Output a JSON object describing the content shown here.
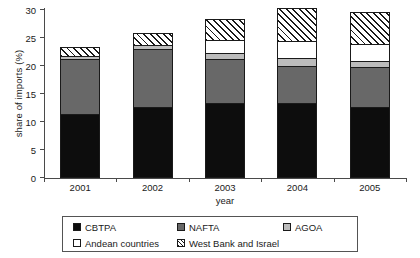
{
  "chart_data": {
    "type": "bar",
    "barmode": "stacked",
    "title": "",
    "xlabel": "year",
    "ylabel": "share of imports (%)",
    "categories": [
      "2001",
      "2002",
      "2003",
      "2004",
      "2005"
    ],
    "ylim": [
      0,
      30
    ],
    "yticks": [
      0,
      5,
      10,
      15,
      20,
      25,
      30
    ],
    "ytick_labels": [
      "0",
      "5",
      "10",
      "15",
      "20",
      "25",
      "30"
    ],
    "grid": false,
    "legend_position": "below-plot",
    "series": [
      {
        "name": "CBTPA",
        "color": "#0d0d0d",
        "pattern": "solid",
        "values": [
          11.3,
          12.5,
          13.2,
          13.3,
          12.5
        ]
      },
      {
        "name": "NAFTA",
        "color": "#686868",
        "pattern": "solid",
        "values": [
          9.8,
          10.3,
          7.8,
          6.6,
          7.2
        ]
      },
      {
        "name": "AGOA",
        "color": "#bcbcbc",
        "pattern": "solid",
        "values": [
          0.5,
          0.7,
          1.2,
          1.3,
          1.0
        ]
      },
      {
        "name": "Andean countries",
        "color": "#ffffff",
        "pattern": "solid",
        "values": [
          0.0,
          0.0,
          2.3,
          3.1,
          3.0
        ]
      },
      {
        "name": "West Bank and Israel",
        "color": "#ffffff",
        "pattern": "hatched",
        "values": [
          1.6,
          2.2,
          3.8,
          5.8,
          5.8
        ]
      }
    ],
    "totals": [
      23.2,
      25.7,
      28.3,
      30.1,
      29.5
    ]
  },
  "legend": {
    "entries": [
      {
        "label": "CBTPA"
      },
      {
        "label": "NAFTA"
      },
      {
        "label": "AGOA"
      },
      {
        "label": "Andean countries"
      },
      {
        "label": "West Bank and Israel"
      }
    ]
  }
}
